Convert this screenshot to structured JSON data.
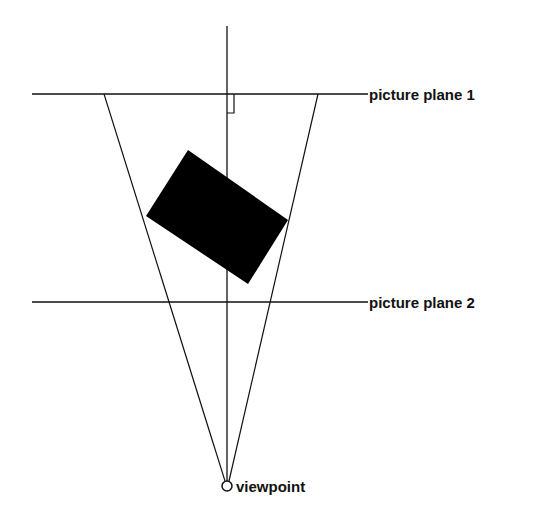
{
  "diagram": {
    "labels": {
      "plane1": "picture plane 1",
      "plane2": "picture plane 2",
      "viewpoint": "viewpoint"
    },
    "colors": {
      "stroke": "#111111",
      "object_fill": "#000000",
      "background": "#ffffff"
    },
    "geometry": {
      "viewpoint": [
        227,
        486
      ],
      "axis": {
        "x": 227,
        "y_top": 26,
        "y_bottom": 482
      },
      "plane1": {
        "y": 94,
        "x1": 32,
        "x2": 368
      },
      "plane2": {
        "y": 302,
        "x1": 32,
        "x2": 368
      },
      "frustum_left_top": [
        104,
        94
      ],
      "frustum_right_top": [
        318,
        94
      ],
      "object_polygon": [
        [
          188,
          150
        ],
        [
          288,
          220
        ],
        [
          248,
          284
        ],
        [
          146,
          216
        ]
      ],
      "right_angle_marker": {
        "x1": 227,
        "x2": 234,
        "y1": 94,
        "y2": 113
      }
    }
  }
}
